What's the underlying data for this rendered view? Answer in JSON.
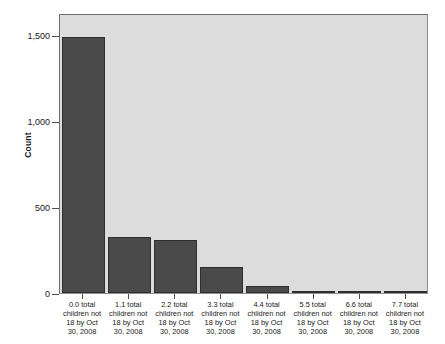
{
  "chart_data": {
    "type": "bar",
    "title": "",
    "subtitle": "",
    "xlabel": "",
    "ylabel": "Count",
    "categories": [
      "0.0 total children not 18 by Oct 30, 2008",
      "1.1 total children not 18 by Oct 30, 2008",
      "2.2 total children not 18 by Oct 30, 2008",
      "3.3 total children not 18 by Oct 30, 2008",
      "4.4 total children not 18 by Oct 30, 2008",
      "5.5 total children not 18 by Oct 30, 2008",
      "6.6 total children not 18 by Oct 30, 2008",
      "7.7 total children not 18 by Oct 30, 2008"
    ],
    "category_lines": [
      [
        "0.0 total",
        "children not",
        "18 by Oct",
        "30, 2008"
      ],
      [
        "1.1 total",
        "children not",
        "18 by Oct",
        "30, 2008"
      ],
      [
        "2.2 total",
        "children not",
        "18 by Oct",
        "30, 2008"
      ],
      [
        "3.3 total",
        "children not",
        "18 by Oct",
        "30, 2008"
      ],
      [
        "4.4 total",
        "children not",
        "18 by Oct",
        "30, 2008"
      ],
      [
        "5.5 total",
        "children not",
        "18 by Oct",
        "30, 2008"
      ],
      [
        "6.6 total",
        "children not",
        "18 by Oct",
        "30, 2008"
      ],
      [
        "7.7 total",
        "children not",
        "18 by Oct",
        "30, 2008"
      ]
    ],
    "values": [
      1490,
      325,
      308,
      150,
      42,
      12,
      10,
      2
    ],
    "ylim": [
      0,
      1630
    ],
    "yticks": [
      0,
      500,
      1000,
      1500
    ],
    "ytick_labels": [
      "0",
      "500",
      "1,000",
      "1,500"
    ],
    "grid": false,
    "legend": false,
    "bar_color": "#4a4a4a",
    "bar_border_color": "#2f2f2f",
    "plot_background": "#dcdcdc",
    "page_background": "#ffffff",
    "axis_color": "#4d4d4d"
  }
}
